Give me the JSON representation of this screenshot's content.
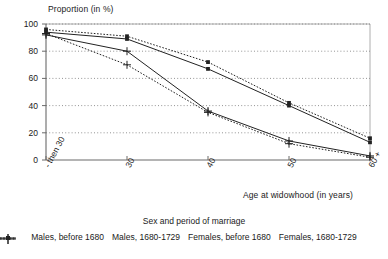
{
  "chart_data": {
    "type": "line",
    "title": "",
    "ylabel": "Proportion (in %)",
    "xlabel": "Age at widowhood (in years)",
    "legend_title": "Sex and period of marriage",
    "legend_position": "bottom",
    "grid": true,
    "ylim": [
      0,
      100
    ],
    "yticks": [
      0,
      20,
      40,
      60,
      80,
      100
    ],
    "ytick_labels": [
      "0",
      "20",
      "40",
      "60",
      "80",
      "100"
    ],
    "categories": [
      "- then 30",
      "30",
      "40",
      "50",
      "60 +"
    ],
    "xtick_labels": [
      "- then 30",
      "30",
      "40",
      "50",
      "60 +"
    ],
    "series": [
      {
        "name": "Males, before 1680",
        "marker": "square",
        "linestyle": "solid",
        "color": "#222222",
        "values": [
          94,
          89,
          67,
          40,
          13
        ]
      },
      {
        "name": "Males, 1680-1729",
        "marker": "square",
        "linestyle": "dotted",
        "color": "#222222",
        "values": [
          96,
          91,
          72,
          42,
          16
        ]
      },
      {
        "name": "Females, before 1680",
        "marker": "plus",
        "linestyle": "solid",
        "color": "#222222",
        "values": [
          92,
          80,
          36,
          14,
          3
        ]
      },
      {
        "name": "Females, 1680-1729",
        "marker": "plus",
        "linestyle": "dotted",
        "color": "#222222",
        "values": [
          93,
          70,
          35,
          12,
          2
        ]
      }
    ]
  },
  "axes": {
    "y_title": "Proportion (in %)",
    "x_title": "Age at widowhood (in years)"
  },
  "legend": {
    "title": "Sex and period of marriage",
    "items": [
      {
        "label": "Males, before 1680"
      },
      {
        "label": "Males, 1680-1729"
      },
      {
        "label": "Females, before 1680"
      },
      {
        "label": "Females, 1680-1729"
      }
    ]
  }
}
